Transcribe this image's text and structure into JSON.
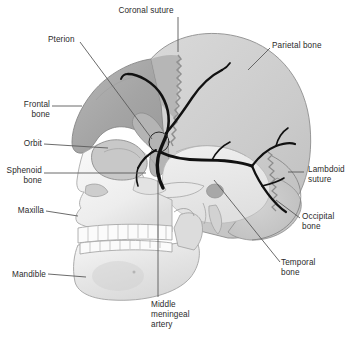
{
  "figure": {
    "type": "anatomical-illustration",
    "width": 351,
    "height": 340,
    "background_color": "#ffffff"
  },
  "palette": {
    "frontal_bone": "#a9a9a9",
    "parietal_bone": "#cfcfcf",
    "temporal_bone": "#ededed",
    "occipital_bone": "#c9c9c9",
    "facial_bone": "#f2f2f2",
    "mandible": "#ececec",
    "sphenoid_bone": "#b4b4b4",
    "teeth": "#fbfbfb",
    "artery": "#111111",
    "outline": "#6f6f6f",
    "leader_line": "#5a5a5a",
    "text": "#2b2b2b"
  },
  "labels": [
    {
      "id": "coronal-suture",
      "text": "Coronal suture",
      "x": 146,
      "y": 6,
      "align": "center"
    },
    {
      "id": "pterion",
      "text": "Pterion",
      "x": 48,
      "y": 35,
      "align": "left"
    },
    {
      "id": "parietal-bone",
      "text": "Parietal bone",
      "x": 272,
      "y": 41,
      "align": "left"
    },
    {
      "id": "frontal-bone",
      "text": "Frontal\nbone",
      "x": 14,
      "y": 100,
      "align": "left"
    },
    {
      "id": "orbit",
      "text": "Orbit",
      "x": 14,
      "y": 140,
      "align": "left"
    },
    {
      "id": "sphenoid-bone",
      "text": "Sphenoid\nbone",
      "x": 4,
      "y": 165,
      "align": "left"
    },
    {
      "id": "lambdoid-suture",
      "text": "Lambdoid\nsuture",
      "x": 306,
      "y": 162,
      "align": "left"
    },
    {
      "id": "maxilla",
      "text": "Maxilla",
      "x": 14,
      "y": 206,
      "align": "left"
    },
    {
      "id": "occipital-bone",
      "text": "Occipital\nbone",
      "x": 302,
      "y": 212,
      "align": "left"
    },
    {
      "id": "temporal-bone",
      "text": "Temporal\nbone",
      "x": 281,
      "y": 258,
      "align": "left"
    },
    {
      "id": "mandible",
      "text": "Mandible",
      "x": 8,
      "y": 269,
      "align": "left"
    },
    {
      "id": "middle-meningeal-artery",
      "text": "Middle\nmeningeal\nartery",
      "x": 151,
      "y": 300,
      "align": "left"
    }
  ],
  "structures": [
    {
      "id": "frontal-bone",
      "name": "Frontal bone"
    },
    {
      "id": "parietal-bone",
      "name": "Parietal bone"
    },
    {
      "id": "temporal-bone",
      "name": "Temporal bone"
    },
    {
      "id": "occipital-bone",
      "name": "Occipital bone"
    },
    {
      "id": "sphenoid-bone",
      "name": "Sphenoid bone"
    },
    {
      "id": "maxilla",
      "name": "Maxilla"
    },
    {
      "id": "mandible",
      "name": "Mandible"
    },
    {
      "id": "orbit",
      "name": "Orbit"
    },
    {
      "id": "coronal-suture",
      "name": "Coronal suture"
    },
    {
      "id": "lambdoid-suture",
      "name": "Lambdoid suture"
    },
    {
      "id": "pterion",
      "name": "Pterion"
    },
    {
      "id": "middle-meningeal-artery",
      "name": "Middle meningeal artery"
    }
  ]
}
